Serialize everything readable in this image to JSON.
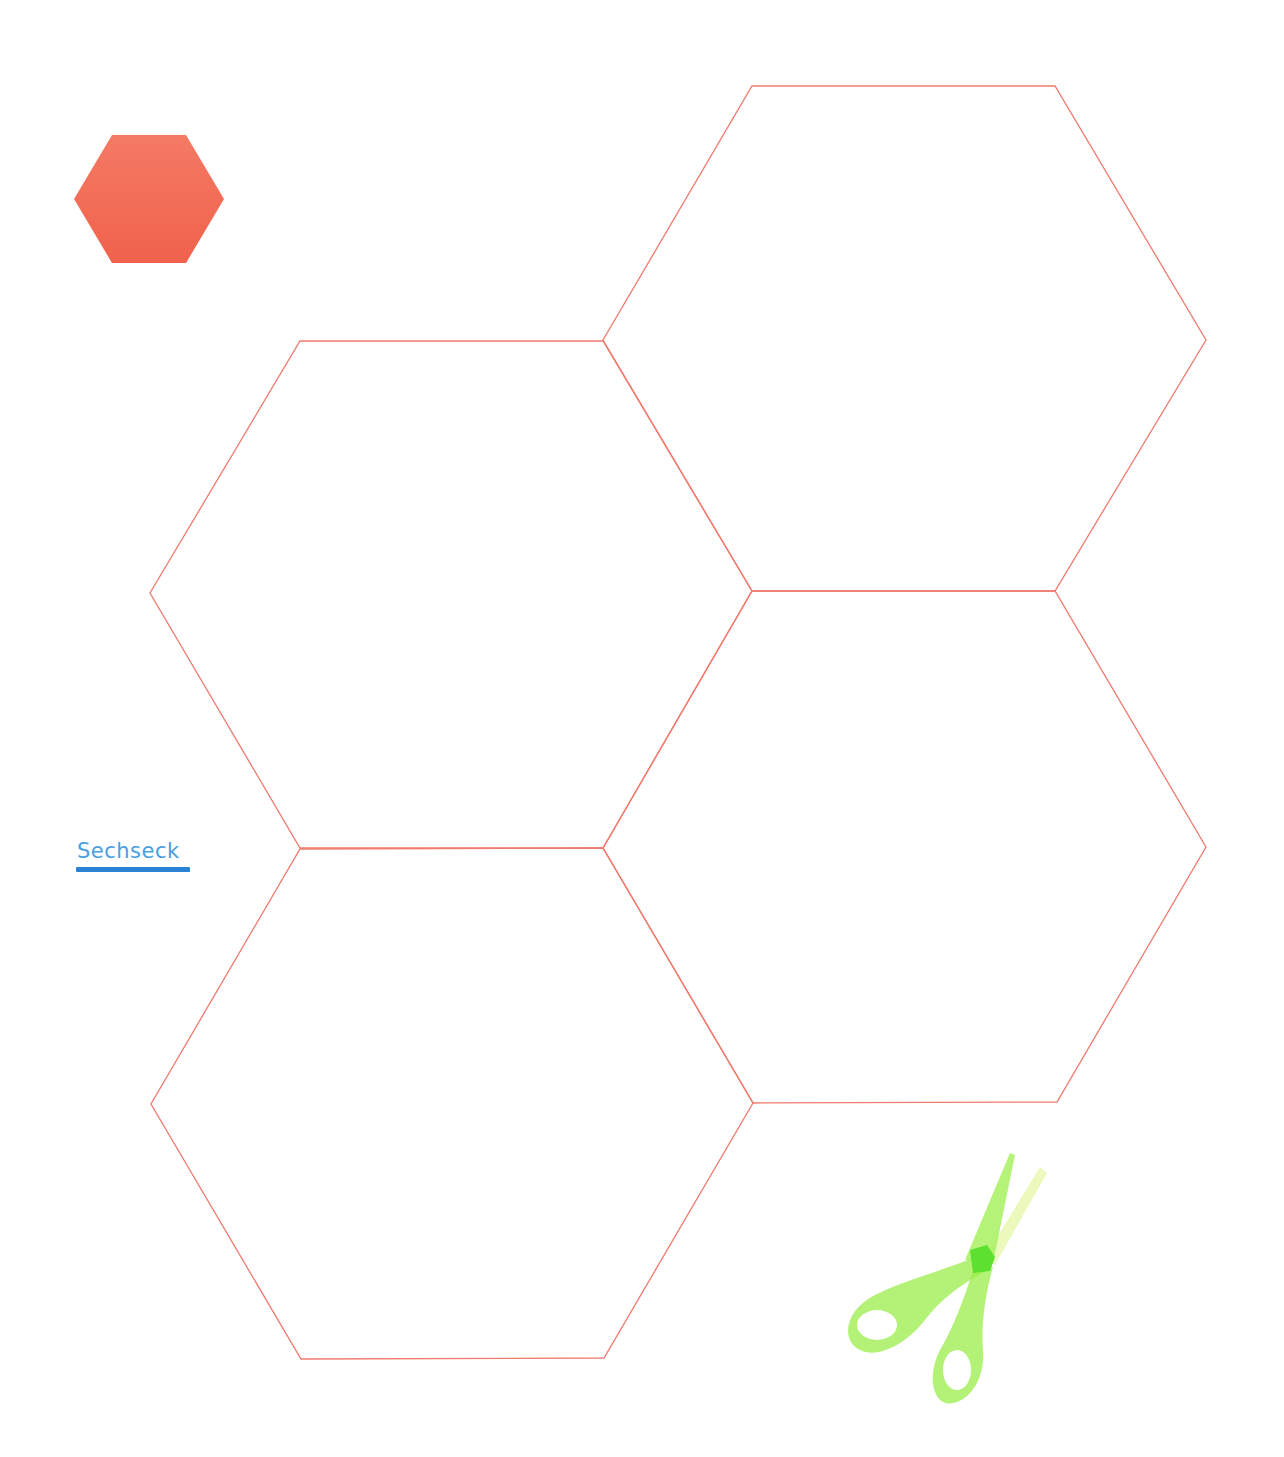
{
  "label": {
    "text": "Sechseck",
    "color": "#4a9ee0",
    "underline_color": "#2a82d4"
  },
  "icons": {
    "small_hexagon": {
      "name": "filled-hexagon-icon",
      "color": "#f26a55"
    },
    "scissors": {
      "name": "scissors-icon",
      "color": "#8ef03c"
    }
  },
  "template": {
    "stroke_color": "#f07a6e",
    "hexagons": [
      {
        "id": "top-right",
        "points": "752,86 1055,86 1206,340 1055,591 752,591 603,340"
      },
      {
        "id": "middle-left",
        "points": "300,341 603,341 752,591 603,848 300,848 150,593"
      },
      {
        "id": "middle-right",
        "points": "752,591 1055,591 1206,847 1057,1102 753,1103 603,848"
      },
      {
        "id": "bottom-left",
        "points": "300,849 603,848 753,1103 604,1358 301,1359 151,1104"
      }
    ]
  }
}
